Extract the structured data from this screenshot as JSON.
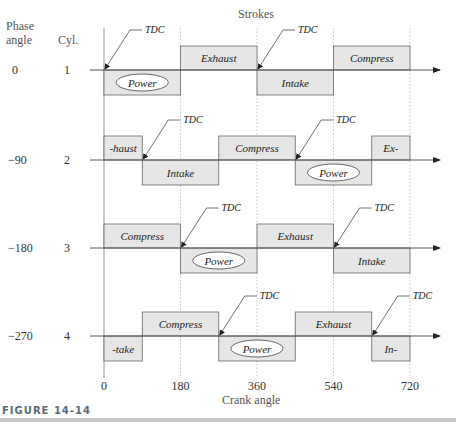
{
  "header": {
    "strokes_label": "Strokes",
    "phase_angle_label_line1": "Phase",
    "phase_angle_label_line2": "angle",
    "cylinder_label": "Cyl."
  },
  "x_axis": {
    "label": "Crank angle",
    "ticks": [
      "0",
      "180",
      "360",
      "540",
      "720"
    ]
  },
  "tdc_label": "TDC",
  "cylinders": [
    {
      "phase": "0",
      "cyl": "1",
      "segments": [
        {
          "label": "Power",
          "from": 0,
          "to": 180,
          "pos": "below",
          "oval": true
        },
        {
          "label": "Exhaust",
          "from": 180,
          "to": 360,
          "pos": "above"
        },
        {
          "label": "Intake",
          "from": 360,
          "to": 540,
          "pos": "below"
        },
        {
          "label": "Compress",
          "from": 540,
          "to": 720,
          "pos": "above"
        }
      ],
      "tdc_at": [
        0,
        360
      ]
    },
    {
      "phase": "−90",
      "cyl": "2",
      "segments": [
        {
          "label": "-haust",
          "from": 0,
          "to": 90,
          "pos": "above"
        },
        {
          "label": "Intake",
          "from": 90,
          "to": 270,
          "pos": "below"
        },
        {
          "label": "Compress",
          "from": 270,
          "to": 450,
          "pos": "above"
        },
        {
          "label": "Power",
          "from": 450,
          "to": 630,
          "pos": "below",
          "oval": true
        },
        {
          "label": "Ex-",
          "from": 630,
          "to": 720,
          "pos": "above"
        }
      ],
      "tdc_at": [
        90,
        450
      ]
    },
    {
      "phase": "−180",
      "cyl": "3",
      "segments": [
        {
          "label": "Compress",
          "from": 0,
          "to": 180,
          "pos": "above"
        },
        {
          "label": "Power",
          "from": 180,
          "to": 360,
          "pos": "below",
          "oval": true
        },
        {
          "label": "Exhaust",
          "from": 360,
          "to": 540,
          "pos": "above"
        },
        {
          "label": "Intake",
          "from": 540,
          "to": 720,
          "pos": "below"
        }
      ],
      "tdc_at": [
        180,
        540
      ]
    },
    {
      "phase": "−270",
      "cyl": "4",
      "segments": [
        {
          "label": "-take",
          "from": 0,
          "to": 90,
          "pos": "below"
        },
        {
          "label": "Compress",
          "from": 90,
          "to": 270,
          "pos": "above"
        },
        {
          "label": "Power",
          "from": 270,
          "to": 450,
          "pos": "below",
          "oval": true
        },
        {
          "label": "Exhaust",
          "from": 450,
          "to": 630,
          "pos": "above"
        },
        {
          "label": "In-",
          "from": 630,
          "to": 720,
          "pos": "below"
        }
      ],
      "tdc_at": [
        270,
        630
      ]
    }
  ],
  "caption": {
    "figure_label": "FIGURE 14-14"
  },
  "colors": {
    "box_fill": "#e6e6e6",
    "box_stroke": "#666666",
    "axis": "#444444",
    "grid": "#999999"
  }
}
